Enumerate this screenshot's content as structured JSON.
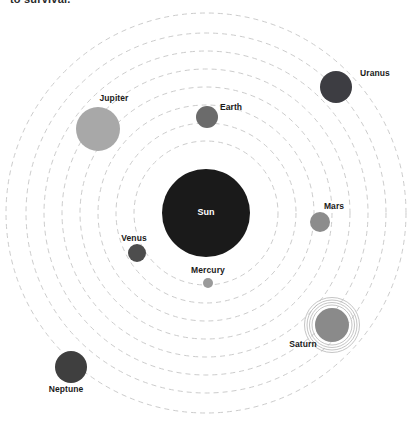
{
  "page": {
    "width": 417,
    "height": 425,
    "background": "#ffffff",
    "cutoff_text": "to survival."
  },
  "chart_data": {
    "type": "scatter",
    "title": "",
    "subtitle": "",
    "xlabel": "",
    "ylabel": "",
    "grid": false,
    "legend_position": "none",
    "layout": {
      "center_x": 206,
      "center_y": 213,
      "orbit_style": "dashed",
      "orbit_color": "#cccccc",
      "orbit_dash": "5 4",
      "orbit_width": 1
    },
    "orbit_radii": [
      72,
      90,
      108,
      126,
      144,
      162,
      180,
      200
    ],
    "categories": [
      "Sun",
      "Mercury",
      "Venus",
      "Earth",
      "Mars",
      "Jupiter",
      "Saturn",
      "Uranus",
      "Neptune"
    ],
    "bodies": [
      {
        "name": "Sun",
        "label": "Sun",
        "cx": 206,
        "cy": 213,
        "r": 44,
        "color": "#1a1a1a",
        "orbit_r": 0,
        "label_x": 206,
        "label_y": 212,
        "label_inside": true,
        "has_rings": false
      },
      {
        "name": "Mercury",
        "label": "Mercury",
        "cx": 208,
        "cy": 283,
        "r": 5,
        "color": "#9a9a9a",
        "orbit_r": 72,
        "label_x": 208,
        "label_y": 270,
        "label_inside": false,
        "has_rings": false
      },
      {
        "name": "Venus",
        "label": "Venus",
        "cx": 137,
        "cy": 253,
        "r": 9,
        "color": "#4d4d4d",
        "orbit_r": 90,
        "label_x": 134,
        "label_y": 238,
        "label_inside": false,
        "has_rings": false
      },
      {
        "name": "Earth",
        "label": "Earth",
        "cx": 207,
        "cy": 117,
        "r": 11,
        "color": "#6b6b6b",
        "orbit_r": 108,
        "label_x": 231,
        "label_y": 107,
        "label_inside": false,
        "has_rings": false
      },
      {
        "name": "Mars",
        "label": "Mars",
        "cx": 320,
        "cy": 222,
        "r": 10,
        "color": "#8c8c8c",
        "orbit_r": 126,
        "label_x": 334,
        "label_y": 206,
        "label_inside": false,
        "has_rings": false
      },
      {
        "name": "Jupiter",
        "label": "Jupiter",
        "cx": 98,
        "cy": 129,
        "r": 22,
        "color": "#a8a8a8",
        "orbit_r": 144,
        "label_x": 114,
        "label_y": 98,
        "label_inside": false,
        "has_rings": false
      },
      {
        "name": "Saturn",
        "label": "Saturn",
        "cx": 332,
        "cy": 325,
        "r": 17,
        "color": "#8a8a8a",
        "orbit_r": 162,
        "label_x": 303,
        "label_y": 344,
        "label_inside": false,
        "has_rings": true,
        "ring_radii": [
          20,
          22.5,
          25,
          27.5
        ]
      },
      {
        "name": "Uranus",
        "label": "Uranus",
        "cx": 336,
        "cy": 87,
        "r": 16,
        "color": "#3d3d42",
        "orbit_r": 180,
        "label_x": 375,
        "label_y": 73,
        "label_inside": false,
        "has_rings": false
      },
      {
        "name": "Neptune",
        "label": "Neptune",
        "cx": 71,
        "cy": 367,
        "r": 16,
        "color": "#3f3f3f",
        "orbit_r": 200,
        "label_x": 66,
        "label_y": 389,
        "label_inside": false,
        "has_rings": false
      }
    ]
  }
}
